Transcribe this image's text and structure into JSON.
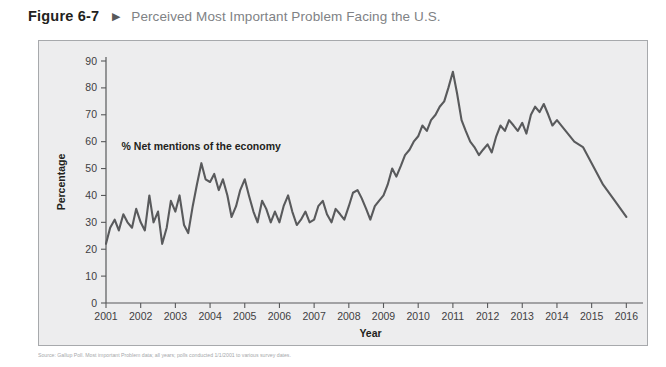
{
  "header": {
    "figure_number": "Figure 6-7",
    "marker_icon": "triangle-right-icon",
    "title": "Perceived Most Important Problem Facing the U.S."
  },
  "source_note": "Source: Gallup Poll. Most important Problem data; all years; polls conducted 1/1/2001 to various survey dates.",
  "chart_data": {
    "type": "line",
    "title": "Perceived Most Important Problem Facing the U.S.",
    "xlabel": "Year",
    "ylabel": "Percentage",
    "xlim": [
      2001,
      2016.25
    ],
    "ylim": [
      0,
      90
    ],
    "ytick_step": 10,
    "yticks": [
      0,
      10,
      20,
      30,
      40,
      50,
      60,
      70,
      80,
      90
    ],
    "xticks": [
      2001,
      2002,
      2003,
      2004,
      2005,
      2006,
      2007,
      2008,
      2009,
      2010,
      2011,
      2012,
      2013,
      2014,
      2015,
      2016
    ],
    "grid": false,
    "legend_position": "none",
    "annotations": [
      {
        "text": "% Net mentions of the economy",
        "x": 2001.45,
        "y": 57
      }
    ],
    "series": [
      {
        "name": "% Net mentions of the economy",
        "color": "#595a5c",
        "x": [
          2001.0,
          2001.12,
          2001.25,
          2001.37,
          2001.5,
          2001.62,
          2001.75,
          2001.87,
          2002.0,
          2002.12,
          2002.25,
          2002.37,
          2002.5,
          2002.62,
          2002.75,
          2002.87,
          2003.0,
          2003.12,
          2003.25,
          2003.37,
          2003.5,
          2003.62,
          2003.75,
          2003.87,
          2004.0,
          2004.12,
          2004.25,
          2004.37,
          2004.5,
          2004.62,
          2004.75,
          2004.87,
          2005.0,
          2005.12,
          2005.25,
          2005.37,
          2005.5,
          2005.62,
          2005.75,
          2005.87,
          2006.0,
          2006.12,
          2006.25,
          2006.37,
          2006.5,
          2006.62,
          2006.75,
          2006.87,
          2007.0,
          2007.12,
          2007.25,
          2007.37,
          2007.5,
          2007.62,
          2007.75,
          2007.87,
          2008.0,
          2008.12,
          2008.25,
          2008.37,
          2008.5,
          2008.62,
          2008.75,
          2008.87,
          2009.0,
          2009.12,
          2009.25,
          2009.37,
          2009.5,
          2009.62,
          2009.75,
          2009.87,
          2010.0,
          2010.12,
          2010.25,
          2010.37,
          2010.5,
          2010.62,
          2010.75,
          2010.87,
          2011.0,
          2011.12,
          2011.25,
          2011.37,
          2011.5,
          2011.62,
          2011.75,
          2011.87,
          2012.0,
          2012.12,
          2012.25,
          2012.37,
          2012.5,
          2012.62,
          2012.75,
          2012.87,
          2013.0,
          2013.12,
          2013.25,
          2013.37,
          2013.5,
          2013.62,
          2013.75,
          2013.87,
          2014.0,
          2014.25,
          2014.5,
          2014.75,
          2015.0,
          2015.33,
          2015.67,
          2016.0
        ],
        "y": [
          22,
          28,
          31,
          27,
          33,
          30,
          28,
          35,
          30,
          27,
          40,
          30,
          34,
          22,
          28,
          38,
          34,
          40,
          29,
          26,
          36,
          44,
          52,
          46,
          45,
          48,
          42,
          46,
          40,
          32,
          36,
          42,
          46,
          40,
          34,
          30,
          38,
          35,
          30,
          34,
          30,
          36,
          40,
          34,
          29,
          31,
          34,
          30,
          31,
          36,
          38,
          33,
          30,
          35,
          33,
          31,
          36,
          41,
          42,
          39,
          35,
          31,
          36,
          38,
          40,
          44,
          50,
          47,
          51,
          55,
          57,
          60,
          62,
          66,
          64,
          68,
          70,
          73,
          75,
          80,
          86,
          78,
          68,
          64,
          60,
          58,
          55,
          57,
          59,
          56,
          62,
          66,
          64,
          68,
          66,
          64,
          67,
          63,
          70,
          73,
          71,
          74,
          70,
          66,
          68,
          64,
          60,
          58,
          52,
          44,
          38,
          32
        ]
      }
    ],
    "series_detailed_path_note": "single continuous line; extreme peak 86 in early 2009, trough 16 in late 2007, trough 21 in 2015, ends at 39 in 2016"
  }
}
